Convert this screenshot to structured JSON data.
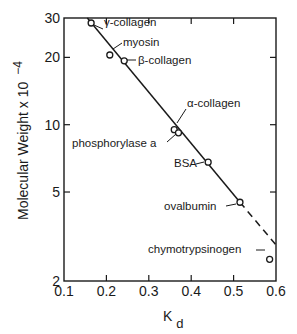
{
  "chart_data": {
    "type": "scatter",
    "title": "",
    "xlabel": "K",
    "xlabel_subscript": "d",
    "ylabel": "Molecular Weight x 10",
    "ylabel_exponent": "−4",
    "xlim": [
      0.1,
      0.6
    ],
    "ylim": [
      2,
      30
    ],
    "yscale": "log",
    "grid": false,
    "legend": "none",
    "x_ticks": [
      0.1,
      0.2,
      0.3,
      0.4,
      0.5,
      0.6
    ],
    "x_tick_labels": [
      "0.1",
      "0.2",
      "0.3",
      "0.4",
      "0.5",
      "0.6"
    ],
    "y_ticks": [
      2,
      5,
      10,
      20,
      30
    ],
    "y_tick_labels": [
      "2",
      "5",
      "10",
      "20",
      "30"
    ],
    "points": [
      {
        "name": "γ-collagen",
        "x": 0.164,
        "y": 28.5
      },
      {
        "name": "myosin",
        "x": 0.208,
        "y": 20.5
      },
      {
        "name": "β-collagen",
        "x": 0.242,
        "y": 19.3
      },
      {
        "name": "α-collagen",
        "x": 0.36,
        "y": 9.5
      },
      {
        "name": "phosphorylase a",
        "x": 0.37,
        "y": 9.2
      },
      {
        "name": "BSA",
        "x": 0.44,
        "y": 6.8
      },
      {
        "name": "ovalbumin",
        "x": 0.515,
        "y": 4.5
      },
      {
        "name": "chymotrypsinogen",
        "x": 0.585,
        "y": 2.5
      }
    ],
    "fit_line": {
      "solid": [
        [
          0.155,
          30
        ],
        [
          0.515,
          4.5
        ]
      ],
      "dashed": [
        [
          0.515,
          4.5
        ],
        [
          0.6,
          2.9
        ]
      ]
    }
  }
}
